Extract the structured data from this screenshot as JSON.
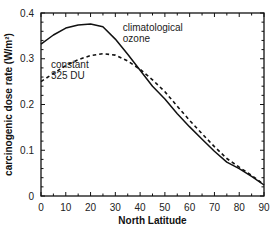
{
  "chart_data": {
    "type": "line",
    "title": "",
    "xlabel": "North Latitude",
    "ylabel": "carcinogenic dose rate (W/m²)",
    "xlim": [
      0,
      90
    ],
    "ylim": [
      0,
      0.4
    ],
    "x_ticks": [
      "0",
      "10",
      "20",
      "30",
      "40",
      "50",
      "60",
      "70",
      "80",
      "90"
    ],
    "y_ticks": [
      "0",
      "0.1",
      "0.2",
      "0.3",
      "0.4"
    ],
    "grid": false,
    "legend": "inline annotations",
    "series": [
      {
        "name": "climatological ozone",
        "style": "solid",
        "x": [
          0,
          5,
          10,
          15,
          20,
          25,
          30,
          35,
          40,
          45,
          50,
          55,
          60,
          65,
          70,
          75,
          80,
          85,
          90
        ],
        "values": [
          0.332,
          0.352,
          0.367,
          0.374,
          0.376,
          0.37,
          0.343,
          0.31,
          0.275,
          0.24,
          0.212,
          0.18,
          0.151,
          0.124,
          0.098,
          0.074,
          0.06,
          0.043,
          0.024
        ]
      },
      {
        "name": "constant 325 DU",
        "style": "dashed",
        "x": [
          0,
          5,
          10,
          15,
          20,
          25,
          30,
          35,
          40,
          45,
          50,
          55,
          60,
          65,
          70,
          75,
          80,
          85,
          90
        ],
        "values": [
          0.25,
          0.268,
          0.285,
          0.298,
          0.307,
          0.311,
          0.308,
          0.295,
          0.277,
          0.254,
          0.228,
          0.196,
          0.165,
          0.136,
          0.108,
          0.082,
          0.063,
          0.045,
          0.025
        ]
      }
    ],
    "annotations": [
      {
        "text_lines": [
          "climatological",
          "ozone"
        ],
        "x": 33,
        "y": 0.36
      },
      {
        "text_lines": [
          "constant",
          "325 DU"
        ],
        "x": 4,
        "y": 0.28
      }
    ]
  }
}
